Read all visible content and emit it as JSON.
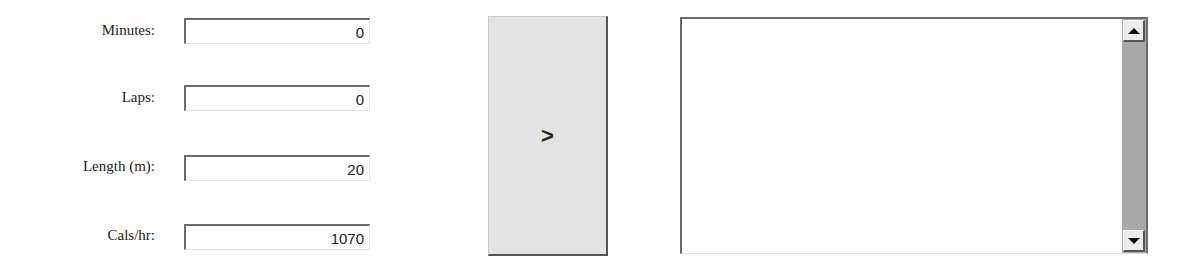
{
  "form": {
    "fields": [
      {
        "label": "Minutes:",
        "value": "0"
      },
      {
        "label": "Laps:",
        "value": "0"
      },
      {
        "label": "Length (m):",
        "value": "20"
      },
      {
        "label": "Cals/hr:",
        "value": "1070"
      }
    ]
  },
  "action_button": {
    "label": ">"
  },
  "output": {
    "text": ""
  },
  "icons": {
    "scroll_up": "triangle-up",
    "scroll_down": "triangle-down"
  }
}
